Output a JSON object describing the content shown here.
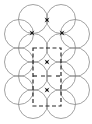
{
  "diagram": {
    "width": 92,
    "height": 124,
    "colors": {
      "background": "#ffffff",
      "circle_stroke": "#8a8a8a",
      "cell_stroke": "#2a2a2a",
      "star_fill": "#1a1a1a"
    },
    "circle_radius": 14.5,
    "circles": [
      {
        "cx": 33,
        "cy": 19
      },
      {
        "cx": 61,
        "cy": 19
      },
      {
        "cx": 19,
        "cy": 34
      },
      {
        "cx": 75,
        "cy": 34
      },
      {
        "cx": 33,
        "cy": 48
      },
      {
        "cx": 61,
        "cy": 48
      },
      {
        "cx": 19,
        "cy": 62
      },
      {
        "cx": 75,
        "cy": 62
      },
      {
        "cx": 33,
        "cy": 76
      },
      {
        "cx": 61,
        "cy": 76
      },
      {
        "cx": 19,
        "cy": 90
      },
      {
        "cx": 75,
        "cy": 90
      },
      {
        "cx": 33,
        "cy": 104
      },
      {
        "cx": 61,
        "cy": 104
      }
    ],
    "stars": [
      {
        "cx": 47,
        "cy": 20
      },
      {
        "cx": 32,
        "cy": 33
      },
      {
        "cx": 62,
        "cy": 33
      },
      {
        "cx": 47,
        "cy": 62
      },
      {
        "cx": 47,
        "cy": 90
      }
    ],
    "unit_cell": {
      "x": 33,
      "y": 48,
      "width": 28,
      "height": 58
    },
    "cell_midline": {
      "y": 76,
      "tick_length": 5
    }
  }
}
